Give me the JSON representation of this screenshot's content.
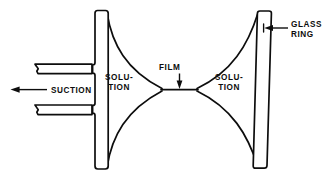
{
  "figure": {
    "kind": "scientific-line-diagram",
    "background_color": "#ffffff",
    "line_color": "#0d0d0d"
  },
  "labels": {
    "suction": "SUCTION",
    "solution_left_line1": "SOLU-",
    "solution_left_line2": "TION",
    "solution_right_line1": "SOLU-",
    "solution_right_line2": "TION",
    "film": "FILM",
    "glass_ring_line1": "GLASS",
    "glass_ring_line2": "RING"
  },
  "annotations": {
    "suction_arrow_direction": "left",
    "film_arrow_direction": "down",
    "glass_ring_arrow_direction": "left"
  },
  "parts": {
    "left_glass_ring": "left-vertical-glass-ring",
    "right_glass_ring": "right-vertical-glass-ring",
    "suction_tube": "horizontal-suction-tube",
    "film_line": "soap-film",
    "meniscus_top": "upper-concave-meniscus",
    "meniscus_bottom": "lower-concave-meniscus"
  }
}
